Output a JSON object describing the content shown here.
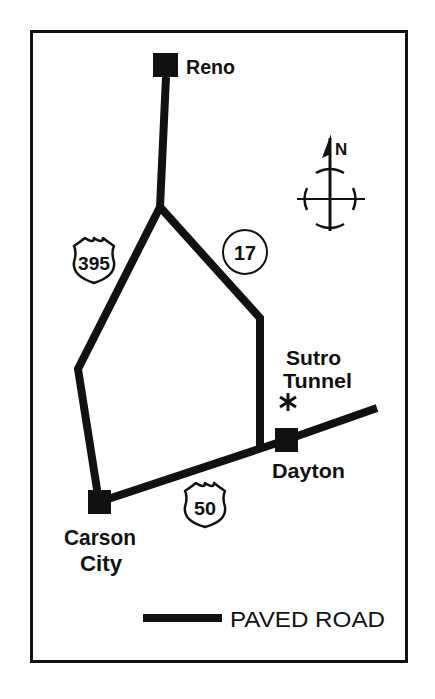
{
  "map": {
    "colors": {
      "ink": "#111111",
      "paper": "#ffffff"
    },
    "cities": [
      {
        "name": "Reno",
        "label_lines": [
          "Reno"
        ]
      },
      {
        "name": "Carson City",
        "label_lines": [
          "Carson",
          "City"
        ]
      },
      {
        "name": "Dayton",
        "label_lines": [
          "Dayton"
        ]
      }
    ],
    "landmarks": [
      {
        "name": "Sutro Tunnel",
        "label_lines": [
          "Sutro",
          "Tunnel"
        ],
        "marker": "*"
      }
    ],
    "route_markers": [
      {
        "type": "us-shield",
        "number": "395"
      },
      {
        "type": "state-circle",
        "number": "17"
      },
      {
        "type": "us-shield",
        "number": "50"
      }
    ],
    "compass": {
      "label": "N"
    },
    "legend": {
      "label": "PAVED ROAD"
    }
  }
}
